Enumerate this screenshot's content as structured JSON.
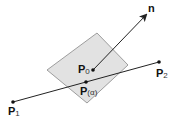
{
  "diagram": {
    "normal_label": "n",
    "p0": {
      "base": "P",
      "sub": "0"
    },
    "palpha": {
      "base": "P",
      "arg": "(α)"
    },
    "p1": {
      "base": "P",
      "sub": "1"
    },
    "p2": {
      "base": "P",
      "sub": "2"
    },
    "colors": {
      "plane_fill": "#e2e2e2",
      "plane_stroke": "#888888",
      "line": "#222222"
    }
  }
}
